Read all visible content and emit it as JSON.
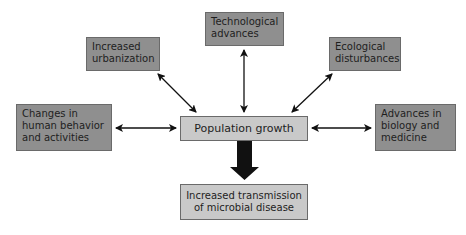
{
  "diagram": {
    "center": {
      "label": "Population growth"
    },
    "outcome": {
      "lines": [
        "Increased transmission",
        "of microbial disease"
      ]
    },
    "factors": [
      {
        "id": "technological",
        "lines": [
          "Technological",
          "advances"
        ]
      },
      {
        "id": "urbanization",
        "lines": [
          "Increased",
          "urbanization"
        ]
      },
      {
        "id": "ecological",
        "lines": [
          "Ecological",
          "disturbances"
        ]
      },
      {
        "id": "human-behavior",
        "lines": [
          "Changes in",
          "human behavior",
          "and activities"
        ]
      },
      {
        "id": "biology-medicine",
        "lines": [
          "Advances in",
          "biology and",
          "medicine"
        ]
      }
    ],
    "relations": [
      {
        "from": "technological",
        "to": "center",
        "type": "bidirectional"
      },
      {
        "from": "urbanization",
        "to": "center",
        "type": "bidirectional"
      },
      {
        "from": "ecological",
        "to": "center",
        "type": "bidirectional"
      },
      {
        "from": "human-behavior",
        "to": "center",
        "type": "bidirectional"
      },
      {
        "from": "biology-medicine",
        "to": "center",
        "type": "bidirectional"
      },
      {
        "from": "center",
        "to": "outcome",
        "type": "causal-bold"
      }
    ],
    "colors": {
      "factor_box": "#8f8f8f",
      "center_box": "#c9c9c9",
      "arrow": "#111111"
    }
  }
}
